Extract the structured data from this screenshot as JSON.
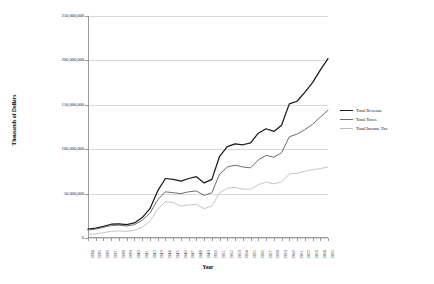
{
  "chart_data": {
    "type": "line",
    "title": "",
    "xlabel": "Year",
    "ylabel": "Thousands of Dollars",
    "ylim": [
      0,
      250000000
    ],
    "ytick_labels": [
      "0",
      "50,000,000",
      "100,000,000",
      "150,000,000",
      "200,000,000",
      "250,000,000"
    ],
    "ytick_values": [
      0,
      50000000,
      100000000,
      150000000,
      200000000,
      250000000
    ],
    "grid": true,
    "legend_position": "right",
    "categories": [
      "1934",
      "1935",
      "1936",
      "1937",
      "1938",
      "1939",
      "1940",
      "1941",
      "1942",
      "1943",
      "1944",
      "1945",
      "1946",
      "1947",
      "1948",
      "1949",
      "1950",
      "1951",
      "1952",
      "1953",
      "1954",
      "1955",
      "1956",
      "1957",
      "1958",
      "1959",
      "1960",
      "1961",
      "1962",
      "1963",
      "1964",
      "1965"
    ],
    "xtick_labels": [
      "1934",
      "1935",
      "1936",
      "1937",
      "1938",
      "1939",
      "1940",
      "1941",
      "1942",
      "1943",
      "1944",
      "1945",
      "1946",
      "1947",
      "1948",
      "1949",
      "1950",
      "1951",
      "1952",
      "1953",
      "1954",
      "1955",
      "1956",
      "1957",
      "1958",
      "1959",
      "1960",
      "1961",
      "1962",
      "1963",
      "1964",
      "1965"
    ],
    "series": [
      {
        "name": "Total Revenue",
        "color": "#1a1a1a",
        "values": [
          10000000,
          11000000,
          13000000,
          15500000,
          16000000,
          15000000,
          17000000,
          23000000,
          33000000,
          53000000,
          67000000,
          66000000,
          64000000,
          67000000,
          69000000,
          62000000,
          66000000,
          92000000,
          103000000,
          106000000,
          105000000,
          107000000,
          118000000,
          123000000,
          120000000,
          127000000,
          151000000,
          154000000,
          164000000,
          175000000,
          189000000,
          202000000
        ]
      },
      {
        "name": "Total Taxes",
        "color": "#6e6e6e",
        "values": [
          9000000,
          10000000,
          12000000,
          14000000,
          14500000,
          13500000,
          15000000,
          20000000,
          28000000,
          43000000,
          52000000,
          51000000,
          50000000,
          52000000,
          53000000,
          48000000,
          51000000,
          72000000,
          80000000,
          82000000,
          80000000,
          79000000,
          88000000,
          93000000,
          91000000,
          96000000,
          114000000,
          117000000,
          122000000,
          128000000,
          136000000,
          144000000
        ]
      },
      {
        "name": "Total Income Tax",
        "color": "#bdbdbd",
        "values": [
          4000000,
          4500000,
          6000000,
          7500000,
          8000000,
          7500000,
          8500000,
          12000000,
          19000000,
          32000000,
          41000000,
          40000000,
          36000000,
          37000000,
          38000000,
          33000000,
          36000000,
          51000000,
          56000000,
          57000000,
          55000000,
          55000000,
          60000000,
          63000000,
          61000000,
          63000000,
          72000000,
          73000000,
          75000000,
          77000000,
          78000000,
          80000000
        ]
      }
    ]
  },
  "legend": {
    "items": [
      {
        "label": "Total Revenue",
        "color": "#1a1a1a"
      },
      {
        "label": "Total Taxes",
        "color": "#6e6e6e"
      },
      {
        "label": "Total Income Tax",
        "color": "#bdbdbd"
      }
    ]
  }
}
